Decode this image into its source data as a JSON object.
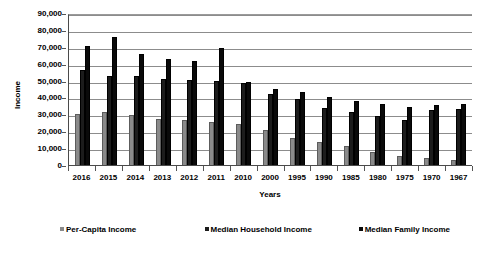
{
  "chart_data": {
    "type": "bar",
    "title": "",
    "xlabel": "Years",
    "ylabel": "Income",
    "ylim": [
      0,
      90000
    ],
    "ytick_labels": [
      "90,000",
      "80,000",
      "70,000",
      "60,000",
      "50,000",
      "40,000",
      "30,000",
      "20,000",
      "10,000",
      "0"
    ],
    "ytick_values": [
      90000,
      80000,
      70000,
      60000,
      50000,
      40000,
      30000,
      20000,
      10000,
      0
    ],
    "grid": true,
    "legend_position": "bottom",
    "categories": [
      "2016",
      "2015",
      "2014",
      "2013",
      "2012",
      "2011",
      "2010",
      "2000",
      "1995",
      "1990",
      "1985",
      "1980",
      "1975",
      "1970",
      "1967"
    ],
    "series": [
      {
        "name": "Per-Capita Income",
        "color": "#8a8a8a",
        "values": [
          30000,
          31500,
          29800,
          27000,
          26500,
          25500,
          24500,
          21000,
          16000,
          13500,
          11000,
          8000,
          5500,
          4000,
          3000
        ]
      },
      {
        "name": "Median Household Income",
        "color": "#1c1c1c",
        "values": [
          56500,
          52800,
          52500,
          51000,
          50500,
          49500,
          48500,
          42000,
          39000,
          34000,
          31500,
          29000,
          26500,
          32500,
          33000
        ]
      },
      {
        "name": "Median Family Income",
        "color": "#0a0a0a",
        "values": [
          70500,
          76000,
          65500,
          63000,
          61500,
          69000,
          49000,
          45000,
          43500,
          40000,
          38000,
          36000,
          34500,
          35500,
          36000
        ]
      }
    ]
  },
  "legend": {
    "items": [
      {
        "label": "Per-Capita Income"
      },
      {
        "label": "Median Household Income"
      },
      {
        "label": "Median Family Income"
      }
    ]
  },
  "axes": {
    "y_title": "Income",
    "x_title": "Years"
  }
}
